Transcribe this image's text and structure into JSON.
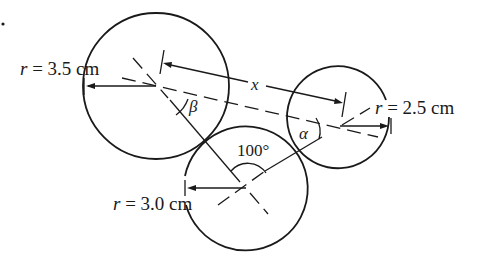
{
  "figure": {
    "marker": "•",
    "circles": [
      {
        "name": "large",
        "radius_label": "r = 3.5 cm",
        "radius_var": "r",
        "radius_value": "= 3.5 cm"
      },
      {
        "name": "bottom",
        "radius_label": "r = 3.0 cm",
        "radius_var": "r",
        "radius_value": "= 3.0 cm"
      },
      {
        "name": "right",
        "radius_label": "r = 2.5 cm",
        "radius_var": "r",
        "radius_value": "= 2.5 cm"
      }
    ],
    "distance_label": "x",
    "angle_between_centers": "100°",
    "angle_alpha": "α",
    "angle_beta": "β"
  },
  "colors": {
    "line": "#1a1a1a",
    "background": "#ffffff"
  }
}
